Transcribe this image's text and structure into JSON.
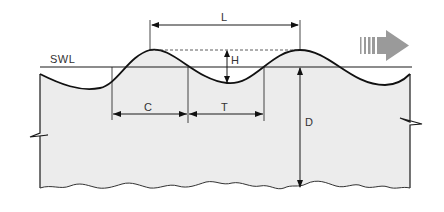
{
  "diagram": {
    "labels": {
      "still_water_level": "SWL",
      "wavelength": "L",
      "wave_height": "H",
      "crest_width": "C",
      "trough_width": "T",
      "depth": "D"
    },
    "direction_arrow": "wave-propagation-direction",
    "colors": {
      "water_fill": "#ececec",
      "line": "#1a1a1a",
      "arrow": "#9a9a9a"
    }
  }
}
